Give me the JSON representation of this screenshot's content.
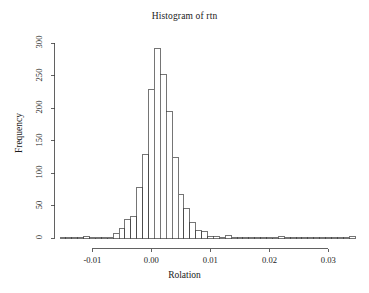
{
  "chart_data": {
    "type": "bar",
    "subtype": "histogram",
    "title": "Histogram of rtn",
    "xlabel": "Rolation",
    "ylabel": "Frequency",
    "grid": false,
    "legend": false,
    "xlim": [
      -0.0155,
      0.0345
    ],
    "ylim": [
      0,
      300
    ],
    "bin_width": 0.001,
    "x_ticks": [
      -0.01,
      0.0,
      0.01,
      0.02,
      0.03
    ],
    "x_tick_labels": [
      "-0.01",
      "0.00",
      "0.01",
      "0.02",
      "0.03"
    ],
    "y_ticks": [
      0,
      50,
      100,
      150,
      200,
      250,
      300
    ],
    "y_tick_labels": [
      "0",
      "50",
      "100",
      "150",
      "200",
      "250",
      "300"
    ],
    "bin_edges": [
      -0.0155,
      -0.0145,
      -0.0135,
      -0.0125,
      -0.0115,
      -0.0105,
      -0.0095,
      -0.0085,
      -0.0075,
      -0.0065,
      -0.0055,
      -0.0045,
      -0.0035,
      -0.0025,
      -0.0015,
      -0.0005,
      0.0005,
      0.0015,
      0.0025,
      0.0035,
      0.0045,
      0.0055,
      0.0065,
      0.0075,
      0.0085,
      0.0095,
      0.0105,
      0.0115,
      0.0125,
      0.0135,
      0.0145,
      0.0155,
      0.0165,
      0.0175,
      0.0185,
      0.0195,
      0.0205,
      0.0215,
      0.0225,
      0.0235,
      0.0245,
      0.0255,
      0.0265,
      0.0275,
      0.0285,
      0.0295,
      0.0305,
      0.0315,
      0.0325,
      0.0335,
      0.0345
    ],
    "values": [
      1,
      0,
      1,
      0,
      3,
      1,
      1,
      0,
      1,
      7,
      14,
      29,
      33,
      78,
      128,
      229,
      292,
      251,
      194,
      124,
      67,
      46,
      24,
      11,
      10,
      3,
      2,
      1,
      4,
      1,
      0,
      1,
      1,
      1,
      1,
      0,
      1,
      2,
      1,
      0,
      0,
      0,
      0,
      0,
      0,
      0,
      0,
      0,
      0,
      2
    ]
  }
}
